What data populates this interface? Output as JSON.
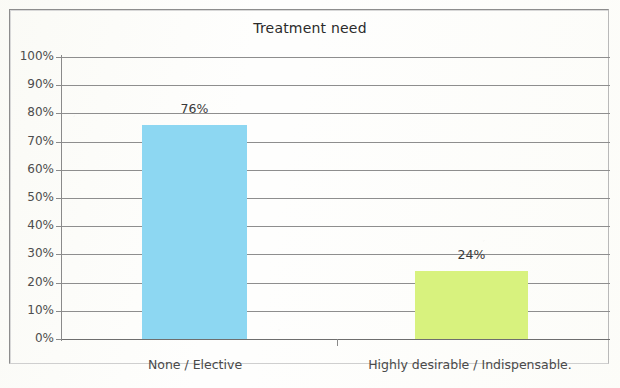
{
  "chart_data": {
    "type": "bar",
    "title": "Treatment need",
    "xlabel": "",
    "ylabel": "",
    "categories": [
      "None / Elective",
      "Highly desirable / Indispensable."
    ],
    "values": [
      76,
      24
    ],
    "data_labels": [
      "76%",
      "24%"
    ],
    "colors": [
      "#8DD7F2",
      "#D8F27E"
    ],
    "ylim": [
      0,
      100
    ],
    "ytick_labels": [
      "100%",
      "90%",
      "80%",
      "70%",
      "60%",
      "50%",
      "40%",
      "30%",
      "20%",
      "10%",
      "0%"
    ],
    "ytick_values": [
      100,
      90,
      80,
      70,
      60,
      50,
      40,
      30,
      20,
      10,
      0
    ],
    "grid": true,
    "legend": false,
    "legend_position": "none"
  },
  "frame": {
    "border_color": "#8d8d8d",
    "background": "#fdfdfb"
  }
}
